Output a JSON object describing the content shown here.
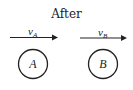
{
  "title": "After",
  "objects": [
    {
      "label": "A",
      "velocity_symbol": "v",
      "velocity_subscript": "A"
    },
    {
      "label": "B",
      "velocity_symbol": "v",
      "velocity_subscript": "B"
    }
  ],
  "colors": {
    "stroke": "#222222",
    "background": "#ffffff"
  }
}
